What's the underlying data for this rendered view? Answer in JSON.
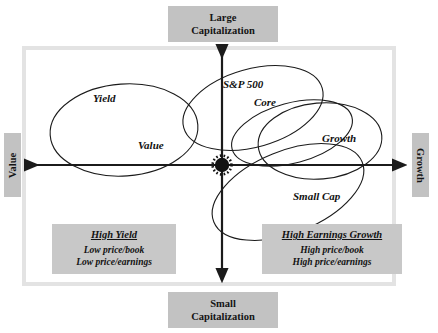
{
  "diagram": {
    "title_boxes": {
      "top": {
        "line1": "Large",
        "line2": "Capitalization"
      },
      "bottom": {
        "line1": "Small",
        "line2": "Capitalization"
      },
      "left": {
        "label": "Value"
      },
      "right": {
        "label": "Growth"
      }
    },
    "axes": {
      "horizontal": {
        "left_end": "Value",
        "right_end": "Growth"
      },
      "vertical": {
        "top_end": "Large Capitalization",
        "bottom_end": "Small Capitalization"
      },
      "origin_marker": "starburst-dot"
    },
    "ellipse_labels": [
      {
        "name": "yield",
        "text": "Yield"
      },
      {
        "name": "value",
        "text": "Value"
      },
      {
        "name": "sp500",
        "text": "S&P 500"
      },
      {
        "name": "core",
        "text": "Core"
      },
      {
        "name": "growth",
        "text": "Growth"
      },
      {
        "name": "small-cap",
        "text": "Small Cap"
      }
    ],
    "info_panels": [
      {
        "name": "high-yield",
        "title": "High Yield",
        "lines": [
          "Low price/book",
          "Low price/earnings"
        ]
      },
      {
        "name": "high-earnings-growth",
        "title": "High Earnings Growth",
        "lines": [
          "High price/book",
          "High price/earnings"
        ]
      }
    ],
    "colors": {
      "box_gray": "#c2c2c2",
      "panel_gray": "#c8c8c8",
      "frame_gray": "#e3e3e3",
      "stroke_black": "#1b1b1b",
      "background": "#ffffff"
    }
  }
}
